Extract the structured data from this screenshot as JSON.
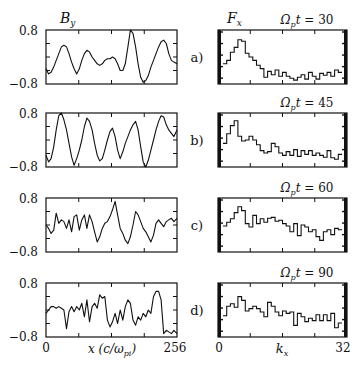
{
  "figure": {
    "left_header": {
      "symbol": "B",
      "subscript": "y"
    },
    "right_header": {
      "symbol": "F",
      "subscript": "x"
    },
    "left_xlabel": {
      "main": "x (c/ω",
      "sub": "pi",
      "close": ")"
    },
    "right_xlabel": {
      "symbol": "k",
      "subscript": "x"
    },
    "left_xticks": [
      "0",
      "256"
    ],
    "right_xticks": [
      "0",
      "32"
    ],
    "ytick_top": "0.8",
    "ytick_bottom": "−0.8"
  },
  "chart_data": [
    {
      "panel": "a)",
      "time_label": "Ω_p t = 30",
      "left": {
        "type": "line",
        "title": "B_y",
        "xlabel": "x (c/ω_pi)",
        "ylabel": "B_y",
        "xlim": [
          0,
          256
        ],
        "ylim": [
          -0.8,
          0.8
        ],
        "x": [
          0,
          5,
          10,
          15,
          20,
          25,
          30,
          35,
          40,
          45,
          50,
          55,
          60,
          65,
          70,
          75,
          80,
          85,
          90,
          95,
          100,
          105,
          110,
          115,
          120,
          125,
          130,
          135,
          140,
          145,
          150,
          155,
          160,
          165,
          170,
          175,
          180,
          185,
          190,
          195,
          200,
          205,
          210,
          215,
          220,
          225,
          230,
          235,
          240,
          245,
          250,
          256
        ],
        "values": [
          -0.35,
          -0.5,
          -0.45,
          -0.3,
          -0.1,
          0.1,
          0.3,
          0.35,
          0.3,
          0.1,
          -0.15,
          -0.35,
          -0.5,
          -0.35,
          -0.1,
          0.1,
          0.2,
          0.15,
          0.0,
          -0.1,
          -0.2,
          -0.25,
          -0.2,
          -0.1,
          -0.05,
          -0.05,
          0.0,
          -0.05,
          -0.2,
          -0.4,
          -0.4,
          -0.2,
          0.3,
          0.8,
          0.7,
          0.3,
          -0.2,
          -0.6,
          -0.75,
          -0.7,
          -0.55,
          -0.3,
          -0.1,
          0.1,
          0.3,
          0.45,
          0.5,
          0.4,
          0.1,
          -0.1,
          -0.15,
          -0.2
        ]
      },
      "right": {
        "type": "bar",
        "title": "F_x",
        "xlabel": "k_x",
        "xlim": [
          0,
          32
        ],
        "ylim": [
          0,
          1
        ],
        "categories": [
          0,
          1,
          2,
          3,
          4,
          5,
          6,
          7,
          8,
          9,
          10,
          11,
          12,
          13,
          14,
          15,
          16,
          17,
          18,
          19,
          20,
          21,
          22,
          23,
          24,
          25,
          26,
          27,
          28,
          29,
          30,
          31
        ],
        "values": [
          0.38,
          0.45,
          0.62,
          0.72,
          0.88,
          0.85,
          0.6,
          0.52,
          0.45,
          0.35,
          0.28,
          0.1,
          0.22,
          0.15,
          0.25,
          0.12,
          0.2,
          0.12,
          0.08,
          0.04,
          0.1,
          0.15,
          0.06,
          0.2,
          0.12,
          0.06,
          0.18,
          0.14,
          0.2,
          0.12,
          0.25,
          0.2
        ]
      }
    },
    {
      "panel": "b)",
      "time_label": "Ω_p t = 45",
      "left": {
        "type": "line",
        "title": "B_y",
        "xlabel": "x (c/ω_pi)",
        "xlim": [
          0,
          256
        ],
        "ylim": [
          -0.8,
          0.8
        ],
        "x": [
          0,
          5,
          10,
          15,
          20,
          25,
          30,
          35,
          40,
          45,
          50,
          55,
          60,
          65,
          70,
          75,
          80,
          85,
          90,
          95,
          100,
          105,
          110,
          115,
          120,
          125,
          130,
          135,
          140,
          145,
          150,
          155,
          160,
          165,
          170,
          175,
          180,
          185,
          190,
          195,
          200,
          205,
          210,
          215,
          220,
          225,
          230,
          235,
          240,
          245,
          250,
          256
        ],
        "values": [
          -0.45,
          -0.65,
          -0.55,
          -0.2,
          0.3,
          0.72,
          0.8,
          0.6,
          0.3,
          -0.1,
          -0.5,
          -0.75,
          -0.55,
          -0.3,
          0.0,
          0.4,
          0.65,
          0.55,
          0.3,
          -0.1,
          -0.45,
          -0.62,
          -0.55,
          -0.3,
          0.0,
          0.25,
          0.35,
          0.1,
          -0.3,
          -0.55,
          -0.35,
          -0.1,
          0.1,
          0.3,
          0.45,
          0.55,
          0.3,
          -0.2,
          -0.65,
          -0.8,
          -0.6,
          -0.3,
          0.0,
          0.3,
          0.55,
          0.72,
          0.68,
          0.45,
          0.3,
          0.2,
          0.1,
          0.3
        ]
      },
      "right": {
        "type": "bar",
        "title": "F_x",
        "xlabel": "k_x",
        "xlim": [
          0,
          32
        ],
        "ylim": [
          0,
          1
        ],
        "categories": [
          0,
          1,
          2,
          3,
          4,
          5,
          6,
          7,
          8,
          9,
          10,
          11,
          12,
          13,
          14,
          15,
          16,
          17,
          18,
          19,
          20,
          21,
          22,
          23,
          24,
          25,
          26,
          27,
          28,
          29,
          30,
          31
        ],
        "values": [
          0.45,
          0.65,
          0.82,
          0.92,
          0.6,
          0.5,
          0.52,
          0.6,
          0.52,
          0.42,
          0.3,
          0.25,
          0.28,
          0.45,
          0.38,
          0.25,
          0.2,
          0.28,
          0.2,
          0.32,
          0.18,
          0.3,
          0.22,
          0.3,
          0.2,
          0.25,
          0.2,
          0.16,
          0.3,
          0.15,
          0.12,
          0.22
        ]
      }
    },
    {
      "panel": "c)",
      "time_label": "Ω_p t = 60",
      "left": {
        "type": "line",
        "title": "B_y",
        "xlabel": "x (c/ω_pi)",
        "xlim": [
          0,
          256
        ],
        "ylim": [
          -0.8,
          0.8
        ],
        "x": [
          0,
          5,
          10,
          15,
          20,
          25,
          30,
          35,
          40,
          45,
          50,
          55,
          60,
          65,
          70,
          75,
          80,
          85,
          90,
          95,
          100,
          105,
          110,
          115,
          120,
          125,
          130,
          135,
          140,
          145,
          150,
          155,
          160,
          165,
          170,
          175,
          180,
          185,
          190,
          195,
          200,
          205,
          210,
          215,
          220,
          225,
          230,
          235,
          240,
          245,
          250,
          256
        ],
        "values": [
          0.0,
          -0.1,
          -0.25,
          -0.15,
          0.35,
          0.05,
          0.15,
          0.1,
          -0.1,
          0.15,
          -0.2,
          0.25,
          0.3,
          -0.15,
          0.15,
          0.3,
          -0.1,
          0.3,
          0.1,
          -0.2,
          -0.5,
          -0.35,
          -0.1,
          0.05,
          0.1,
          0.25,
          0.45,
          0.7,
          0.3,
          -0.1,
          -0.25,
          -0.45,
          -0.55,
          -0.35,
          0.0,
          0.4,
          0.3,
          0.1,
          -0.1,
          -0.2,
          -0.35,
          -0.5,
          -0.3,
          0.05,
          0.15,
          0.05,
          -0.05,
          0.1,
          0.15,
          0.2,
          0.1,
          0.2
        ]
      },
      "right": {
        "type": "bar",
        "title": "F_x",
        "xlabel": "k_x",
        "xlim": [
          0,
          32
        ],
        "ylim": [
          0,
          1
        ],
        "categories": [
          0,
          1,
          2,
          3,
          4,
          5,
          6,
          7,
          8,
          9,
          10,
          11,
          12,
          13,
          14,
          15,
          16,
          17,
          18,
          19,
          20,
          21,
          22,
          23,
          24,
          25,
          26,
          27,
          28,
          29,
          30,
          31
        ],
        "values": [
          0.5,
          0.58,
          0.65,
          0.78,
          0.9,
          0.82,
          0.55,
          0.48,
          0.72,
          0.55,
          0.65,
          0.58,
          0.66,
          0.68,
          0.6,
          0.62,
          0.55,
          0.5,
          0.38,
          0.55,
          0.3,
          0.52,
          0.48,
          0.38,
          0.42,
          0.28,
          0.2,
          0.38,
          0.42,
          0.32,
          0.45,
          0.42
        ]
      }
    },
    {
      "panel": "d)",
      "time_label": "Ω_p t = 90",
      "left": {
        "type": "line",
        "title": "B_y",
        "xlabel": "x (c/ω_pi)",
        "xlim": [
          0,
          256
        ],
        "ylim": [
          -0.8,
          0.8
        ],
        "x": [
          0,
          5,
          10,
          15,
          20,
          25,
          30,
          35,
          40,
          45,
          50,
          55,
          60,
          65,
          70,
          75,
          80,
          85,
          90,
          95,
          100,
          105,
          110,
          115,
          120,
          125,
          130,
          135,
          140,
          145,
          150,
          155,
          160,
          165,
          170,
          175,
          180,
          185,
          190,
          195,
          200,
          205,
          210,
          215,
          220,
          225,
          230,
          235,
          240,
          245,
          250,
          256
        ],
        "values": [
          -0.1,
          0.0,
          0.1,
          0.1,
          0.05,
          0.1,
          0.05,
          0.0,
          -0.55,
          -0.05,
          0.1,
          -0.05,
          0.1,
          0.0,
          0.2,
          -0.2,
          0.3,
          -0.35,
          0.1,
          0.2,
          0.05,
          0.45,
          0.35,
          0.4,
          -0.3,
          -0.5,
          -0.35,
          -0.1,
          -0.4,
          0.0,
          -0.3,
          0.1,
          0.3,
          0.2,
          -0.3,
          -0.45,
          -0.2,
          -0.3,
          -0.1,
          -0.2,
          0.0,
          -0.1,
          0.4,
          0.55,
          0.55,
          0.3,
          -0.7,
          -0.6,
          -0.65,
          -0.7,
          -0.6,
          -0.7
        ]
      },
      "right": {
        "type": "bar",
        "title": "F_x",
        "xlabel": "k_x",
        "xlim": [
          0,
          32
        ],
        "ylim": [
          0,
          1
        ],
        "categories": [
          0,
          1,
          2,
          3,
          4,
          5,
          6,
          7,
          8,
          9,
          10,
          11,
          12,
          13,
          14,
          15,
          16,
          17,
          18,
          19,
          20,
          21,
          22,
          23,
          24,
          25,
          26,
          27,
          28,
          29,
          30,
          31
        ],
        "values": [
          0.4,
          0.6,
          0.65,
          0.58,
          0.8,
          0.72,
          0.5,
          0.55,
          0.6,
          0.55,
          0.48,
          0.38,
          0.68,
          0.6,
          0.48,
          0.4,
          0.5,
          0.45,
          0.48,
          0.2,
          0.45,
          0.38,
          0.28,
          0.35,
          0.3,
          0.42,
          0.3,
          0.42,
          0.3,
          0.45,
          0.15,
          0.25
        ]
      }
    }
  ]
}
